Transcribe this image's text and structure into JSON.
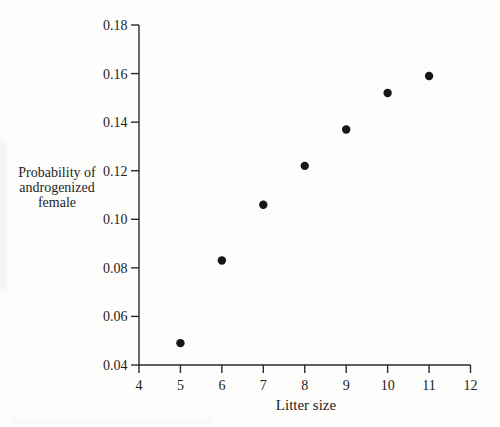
{
  "figure": {
    "paper_color": "#fdfdfb",
    "ink_color": "#1e1e1e"
  },
  "chart_data": {
    "type": "scatter",
    "x": [
      5,
      6,
      7,
      8,
      9,
      10,
      11
    ],
    "y": [
      0.049,
      0.083,
      0.106,
      0.122,
      0.137,
      0.152,
      0.159
    ],
    "title": "",
    "xlabel": "Litter size",
    "ylabel": "Probability of\nandrogenized\nfemale",
    "xlim": [
      4,
      12
    ],
    "ylim": [
      0.04,
      0.18
    ],
    "x_ticks": [
      4,
      5,
      6,
      7,
      8,
      9,
      10,
      11,
      12
    ],
    "x_tick_labels": [
      "4",
      "5",
      "6",
      "7",
      "8",
      "9",
      "10",
      "11",
      "12"
    ],
    "y_ticks": [
      0.04,
      0.06,
      0.08,
      0.1,
      0.12,
      0.14,
      0.16,
      0.18
    ],
    "y_tick_labels": [
      "0.04",
      "0.06",
      "0.08",
      "0.10",
      "0.12",
      "0.14",
      "0.16",
      "0.18"
    ],
    "grid": false,
    "legend_position": "none",
    "marker": {
      "shape": "circle",
      "radius_px": 4.2,
      "color": "#161616"
    },
    "axis_color": "#2b2b2b"
  }
}
